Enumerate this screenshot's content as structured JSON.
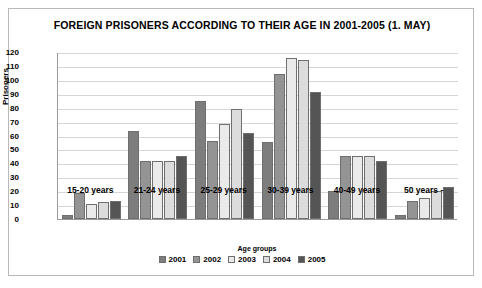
{
  "chart_data": {
    "type": "bar",
    "title": "FOREIGN PRISONERS ACCORDING TO THEIR AGE IN  2001-2005 (1. MAY)",
    "xlabel": "Age groups",
    "ylabel": "Prisoners",
    "categories": [
      "15-20 years",
      "21-24 years",
      "25-29 years",
      "30-39 years",
      "40-49 years",
      "50 years -"
    ],
    "ylim": [
      0,
      120
    ],
    "ytick_step": 10,
    "yticks": [
      "120",
      "110",
      "100",
      "90",
      "80",
      "70",
      "60",
      "50",
      "40",
      "30",
      "20",
      "10",
      "0"
    ],
    "grid": true,
    "legend_position": "bottom",
    "series": [
      {
        "name": "2001",
        "color": "#7d7d7d",
        "values": [
          3,
          63,
          85,
          55,
          20,
          3
        ]
      },
      {
        "name": "2002",
        "color": "#949494",
        "values": [
          19,
          42,
          56,
          104,
          45,
          13
        ]
      },
      {
        "name": "2003",
        "color": "#eaeaea",
        "values": [
          11,
          42,
          68,
          116,
          45,
          15
        ]
      },
      {
        "name": "2004",
        "color": "#dcdcdc",
        "values": [
          12,
          42,
          79,
          114,
          45,
          20
        ]
      },
      {
        "name": "2005",
        "color": "#555555",
        "values": [
          13,
          45,
          62,
          91,
          42,
          23
        ]
      }
    ]
  },
  "footer": {
    "note": ""
  }
}
